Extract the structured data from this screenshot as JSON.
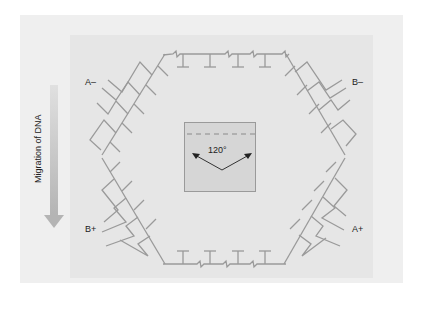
{
  "diagram": {
    "type": "pulsed-field gel electrophoresis (hexagonal electrode array)",
    "labels": {
      "a_minus": "A–",
      "b_minus": "B–",
      "b_plus": "B+",
      "a_plus": "A+"
    },
    "migration": {
      "label": "Migration of DNA",
      "arrow_direction": "down"
    },
    "center_box": {
      "angle_label": "120°"
    },
    "colors": {
      "outer_panel": "#efefef",
      "inner_panel": "#e6e6e6",
      "center_box": "#d6d6d6",
      "strand_lines": "#9a9a9a",
      "arrow": "#bdbdbd",
      "text": "#222222"
    }
  }
}
